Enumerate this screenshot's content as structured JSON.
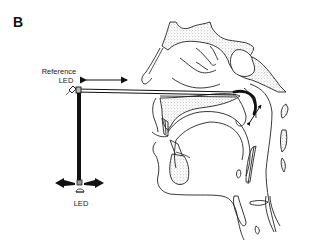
{
  "figure": {
    "panel_letter": "B",
    "labels": {
      "reference_led_line1": "Reference",
      "reference_led_line2": "LED",
      "led": "LED"
    },
    "colors": {
      "ink": "#111111",
      "stipple": "#9a9a9a",
      "background": "#ffffff"
    },
    "elements": [
      "reference-led",
      "horizontal-rod",
      "vertical-rod",
      "bottom-led",
      "double-arrow-horizontal",
      "left-right-arrows",
      "palatal-sensor-curve",
      "small-double-arrow",
      "sagittal-head-anatomy"
    ]
  }
}
